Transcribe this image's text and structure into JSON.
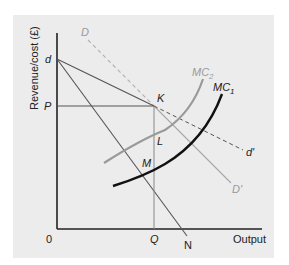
{
  "diagram": {
    "y_axis_label": "Revenue/cost (£)",
    "x_axis_label": "Output",
    "origin_label": "0",
    "price_label": "P",
    "quantity_label": "Q",
    "kink_price_label": "d",
    "points": {
      "K": "K",
      "L": "L",
      "M": "M"
    },
    "curves": {
      "D": "D",
      "D_prime": "D'",
      "d_prime": "d'",
      "N": "N",
      "MC1": "MC",
      "MC1_sub": "1",
      "MC2": "MC",
      "MC2_sub": "2"
    },
    "colors": {
      "panel_bg": "#ececec",
      "axis": "#222222",
      "mc1": "#111111",
      "mc2": "#999999",
      "demand_gray": "#a8a8a8",
      "lines_dark": "#555555"
    }
  }
}
